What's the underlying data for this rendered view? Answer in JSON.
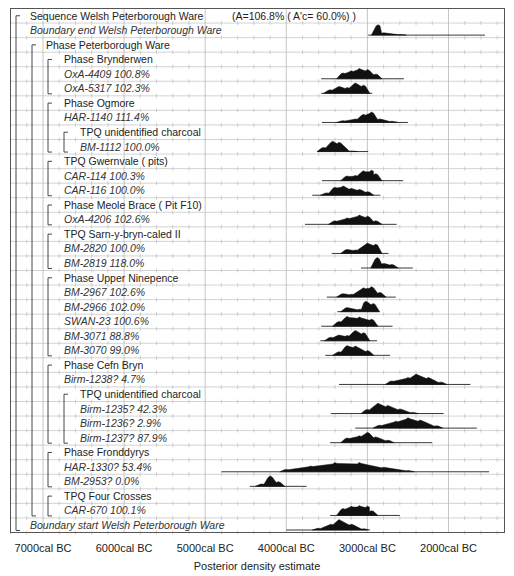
{
  "chart_data": {
    "type": "oxcal-multiplot",
    "title": "Sequence Welsh Peterborough Ware",
    "title_annotation": "(A=106.8% ( A'c= 60.0%) )",
    "xlabel": "Posterior density estimate",
    "ylabel": "",
    "x_ticks": [
      "7000cal BC",
      "6000cal BC",
      "5000cal BC",
      "4000cal BC",
      "3000cal BC",
      "2000cal BC"
    ],
    "x_tick_values": [
      7000,
      6000,
      5000,
      4000,
      3000,
      2000
    ],
    "xlim_calBC": [
      7400,
      1300
    ],
    "grid": true,
    "rows": [
      {
        "label": "Sequence Welsh Peterborough Ware",
        "kind": "sequence",
        "indent": 1,
        "italic": false,
        "annotation": "(A=106.8% ( A'c= 60.0%) )"
      },
      {
        "label": "Boundary end Welsh Peterborough Ware",
        "kind": "boundary",
        "indent": 1,
        "italic": true,
        "range": [
          2990,
          1550
        ],
        "peaks": [
          [
            2870,
            0.9
          ],
          [
            2800,
            0.2
          ],
          [
            2600,
            0.05
          ]
        ]
      },
      {
        "label": "Phase Peterborough Ware",
        "kind": "phase",
        "indent": 2,
        "italic": false
      },
      {
        "label": "Phase Brynderwen",
        "kind": "phase",
        "indent": 3,
        "italic": false
      },
      {
        "label": "OxA-4409  100.8%",
        "kind": "date",
        "indent": 3,
        "italic": true,
        "range": [
          3570,
          2550
        ],
        "peaks": [
          [
            3300,
            0.5
          ],
          [
            3200,
            0.7
          ],
          [
            3100,
            0.9
          ],
          [
            3000,
            0.8
          ],
          [
            2900,
            0.4
          ]
        ]
      },
      {
        "label": "OxA-5317  102.3%",
        "kind": "date",
        "indent": 3,
        "italic": true,
        "range": [
          3570,
          2940
        ],
        "peaks": [
          [
            3460,
            0.3
          ],
          [
            3350,
            0.6
          ],
          [
            3250,
            0.5
          ],
          [
            3150,
            0.9
          ],
          [
            3050,
            0.7
          ]
        ]
      },
      {
        "label": "Phase Ogmore",
        "kind": "phase",
        "indent": 3,
        "italic": false
      },
      {
        "label": "HAR-1140  111.4%",
        "kind": "date",
        "indent": 3,
        "italic": true,
        "range": [
          3560,
          2500
        ],
        "peaks": [
          [
            3300,
            0.15
          ],
          [
            3150,
            0.3
          ],
          [
            3050,
            0.7
          ],
          [
            2950,
            0.9
          ],
          [
            2850,
            0.3
          ],
          [
            2700,
            0.1
          ]
        ]
      },
      {
        "label": "TPQ unidentified charcoal",
        "kind": "phase",
        "indent": 4,
        "italic": false
      },
      {
        "label": "BM-1112  100.0%",
        "kind": "date",
        "indent": 4,
        "italic": true,
        "range": [
          3620,
          2990
        ],
        "peaks": [
          [
            3540,
            0.35
          ],
          [
            3430,
            0.9
          ],
          [
            3350,
            0.8
          ],
          [
            3200,
            0.05
          ]
        ]
      },
      {
        "label": "TPQ Gwernvale  ( pits)",
        "kind": "phase",
        "indent": 3,
        "italic": false
      },
      {
        "label": "CAR-114  100.3%",
        "kind": "date",
        "indent": 3,
        "italic": true,
        "range": [
          3560,
          2560
        ],
        "peaks": [
          [
            3250,
            0.4
          ],
          [
            3150,
            0.45
          ],
          [
            3050,
            0.85
          ],
          [
            2950,
            0.9
          ],
          [
            2900,
            0.6
          ]
        ]
      },
      {
        "label": "CAR-116  100.0%",
        "kind": "date",
        "indent": 3,
        "italic": true,
        "range": [
          3680,
          2840
        ],
        "peaks": [
          [
            3500,
            0.2
          ],
          [
            3400,
            0.7
          ],
          [
            3300,
            0.8
          ],
          [
            3200,
            0.6
          ],
          [
            3100,
            0.5
          ],
          [
            3000,
            0.3
          ]
        ]
      },
      {
        "label": "Phase Meole Brace  ( Pit F10)",
        "kind": "phase",
        "indent": 3,
        "italic": false
      },
      {
        "label": "OxA-4206  102.6%",
        "kind": "date",
        "indent": 3,
        "italic": true,
        "range": [
          3770,
          2640
        ],
        "peaks": [
          [
            3400,
            0.3
          ],
          [
            3250,
            0.55
          ],
          [
            3100,
            0.8
          ],
          [
            3000,
            0.7
          ],
          [
            2900,
            0.3
          ]
        ]
      },
      {
        "label": "TPQ Sarn-y-bryn-caled II",
        "kind": "phase",
        "indent": 3,
        "italic": false
      },
      {
        "label": "BM-2820  100.0%",
        "kind": "date",
        "indent": 3,
        "italic": true,
        "range": [
          3440,
          2740
        ],
        "peaks": [
          [
            3250,
            0.35
          ],
          [
            3150,
            0.3
          ],
          [
            3000,
            0.9
          ],
          [
            2900,
            0.8
          ]
        ]
      },
      {
        "label": "BM-2819  118.0%",
        "kind": "date",
        "indent": 3,
        "italic": true,
        "range": [
          3080,
          2440
        ],
        "peaks": [
          [
            2880,
            0.9
          ],
          [
            2800,
            0.4
          ],
          [
            2700,
            0.3
          ]
        ]
      },
      {
        "label": "Phase Upper Ninepence",
        "kind": "phase",
        "indent": 3,
        "italic": false
      },
      {
        "label": "BM-2967  102.6%",
        "kind": "date",
        "indent": 3,
        "italic": true,
        "range": [
          3500,
          2650
        ],
        "peaks": [
          [
            3300,
            0.3
          ],
          [
            3200,
            0.25
          ],
          [
            3050,
            0.8
          ],
          [
            2950,
            0.9
          ],
          [
            2850,
            0.4
          ]
        ]
      },
      {
        "label": "BM-2966  102.0%",
        "kind": "date",
        "indent": 3,
        "italic": true,
        "range": [
          3370,
          2850
        ],
        "peaks": [
          [
            3250,
            0.35
          ],
          [
            3100,
            0.2
          ],
          [
            3020,
            0.9
          ],
          [
            2930,
            0.7
          ]
        ]
      },
      {
        "label": "SWAN-23  100.6%",
        "kind": "date",
        "indent": 3,
        "italic": true,
        "range": [
          3570,
          2690
        ],
        "peaks": [
          [
            3350,
            0.4
          ],
          [
            3250,
            0.85
          ],
          [
            3100,
            0.8
          ],
          [
            2950,
            0.6
          ]
        ]
      },
      {
        "label": "BM-3071  88.8%",
        "kind": "date",
        "indent": 3,
        "italic": true,
        "range": [
          3580,
          2880
        ],
        "peaks": [
          [
            3450,
            0.3
          ],
          [
            3350,
            0.5
          ],
          [
            3250,
            0.45
          ],
          [
            3150,
            0.9
          ],
          [
            3050,
            0.7
          ]
        ]
      },
      {
        "label": "BM-3070  99.0%",
        "kind": "date",
        "indent": 3,
        "italic": true,
        "range": [
          3520,
          2720
        ],
        "peaks": [
          [
            3350,
            0.3
          ],
          [
            3250,
            0.85
          ],
          [
            3150,
            0.8
          ],
          [
            3000,
            0.4
          ]
        ]
      },
      {
        "label": "Phase Cefn Bryn",
        "kind": "phase",
        "indent": 3,
        "italic": false
      },
      {
        "label": "Birm-1238?   4.7%",
        "kind": "date",
        "indent": 3,
        "italic": true,
        "range": [
          3350,
          1730
        ],
        "peaks": [
          [
            2700,
            0.3
          ],
          [
            2500,
            0.6
          ],
          [
            2400,
            0.9
          ],
          [
            2250,
            0.6
          ],
          [
            2100,
            0.2
          ]
        ]
      },
      {
        "label": "TPQ unidentified charcoal",
        "kind": "phase",
        "indent": 4,
        "italic": false
      },
      {
        "label": "Birm-1235?  42.3%",
        "kind": "date",
        "indent": 4,
        "italic": true,
        "range": [
          3450,
          2060
        ],
        "peaks": [
          [
            3000,
            0.35
          ],
          [
            2870,
            0.9
          ],
          [
            2750,
            0.7
          ],
          [
            2600,
            0.4
          ],
          [
            2450,
            0.1
          ]
        ]
      },
      {
        "label": "Birm-1236?   2.9%",
        "kind": "date",
        "indent": 4,
        "italic": true,
        "range": [
          3150,
          1650
        ],
        "peaks": [
          [
            2850,
            0.25
          ],
          [
            2650,
            0.6
          ],
          [
            2500,
            0.9
          ],
          [
            2350,
            0.7
          ],
          [
            2150,
            0.2
          ]
        ]
      },
      {
        "label": "Birm-1237?  87.9%",
        "kind": "date",
        "indent": 4,
        "italic": true,
        "range": [
          3460,
          2200
        ],
        "peaks": [
          [
            3250,
            0.4
          ],
          [
            3100,
            0.6
          ],
          [
            3000,
            0.9
          ],
          [
            2900,
            0.5
          ],
          [
            2750,
            0.2
          ]
        ]
      },
      {
        "label": "Phase Fronddyrys",
        "kind": "phase",
        "indent": 3,
        "italic": false
      },
      {
        "label": "HAR-1330?  53.4%",
        "kind": "date",
        "indent": 3,
        "italic": true,
        "range": [
          4800,
          1500
        ],
        "peaks": [
          [
            4000,
            0.2
          ],
          [
            3700,
            0.5
          ],
          [
            3400,
            0.8
          ],
          [
            3100,
            0.8
          ],
          [
            2800,
            0.4
          ],
          [
            2500,
            0.1
          ]
        ]
      },
      {
        "label": "BM-2953?   0.0%",
        "kind": "date",
        "indent": 3,
        "italic": true,
        "range": [
          4450,
          3750
        ],
        "peaks": [
          [
            4300,
            0.2
          ],
          [
            4200,
            0.9
          ],
          [
            4100,
            0.4
          ]
        ]
      },
      {
        "label": "TPQ Four Crosses",
        "kind": "phase",
        "indent": 3,
        "italic": false
      },
      {
        "label": "CAR-670  100.1%",
        "kind": "date",
        "indent": 3,
        "italic": true,
        "range": [
          3460,
          2600
        ],
        "peaks": [
          [
            3300,
            0.6
          ],
          [
            3200,
            0.8
          ],
          [
            3100,
            0.85
          ],
          [
            3000,
            0.8
          ],
          [
            2950,
            0.4
          ]
        ]
      },
      {
        "label": "Boundary start Welsh Peterborough Ware",
        "kind": "boundary",
        "indent": 1,
        "italic": true,
        "range": [
          6000,
          3000
        ],
        "peaks": [
          [
            3600,
            0.15
          ],
          [
            3450,
            0.5
          ],
          [
            3350,
            0.9
          ],
          [
            3200,
            0.5
          ],
          [
            3050,
            0.1
          ]
        ],
        "range_line_left": 4000
      }
    ]
  }
}
